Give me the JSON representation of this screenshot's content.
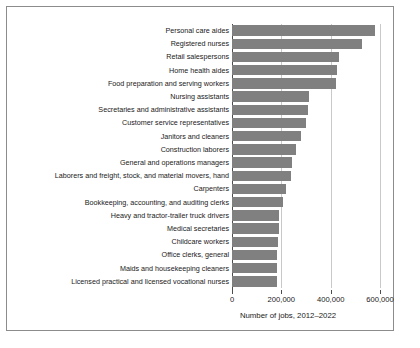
{
  "chart_data": {
    "type": "bar",
    "orientation": "horizontal",
    "title": "",
    "xlabel": "Number of jobs, 2012–2022",
    "ylabel": "",
    "xlim": [
      0,
      620000
    ],
    "xticks": [
      0,
      200000,
      400000,
      600000
    ],
    "xtick_labels": [
      "0",
      "200,000",
      "400,000",
      "600,000"
    ],
    "grid": "vertical",
    "legend": "none",
    "bar_color": "#808080",
    "categories": [
      "Personal care aides",
      "Registered nurses",
      "Retail salespersons",
      "Home health aides",
      "Food preparation and serving workers",
      "Nursing assistants",
      "Secretaries and administrative assistants",
      "Customer service representatives",
      "Janitors and cleaners",
      "Construction laborers",
      "General and operations managers",
      "Laborers and freight, stock, and material movers, hand",
      "Carpenters",
      "Bookkeeping, accounting, and auditing clerks",
      "Heavy and tractor-trailer truck drivers",
      "Medical secretaries",
      "Childcare workers",
      "Office clerks, general",
      "Maids and housekeeping cleaners",
      "Licensed practical and licensed vocational nurses"
    ],
    "values": [
      580000,
      527000,
      435000,
      424000,
      421000,
      312000,
      308000,
      299000,
      280000,
      259000,
      244000,
      240000,
      218000,
      205000,
      192000,
      189000,
      185000,
      184000,
      183000,
      182000
    ]
  }
}
